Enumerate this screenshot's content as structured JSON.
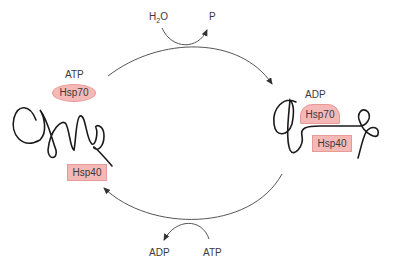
{
  "diagram": {
    "colors": {
      "chaperone_fill": "#f4b9b6",
      "chaperone_border": "#e89a96",
      "line": "#555555",
      "strand": "#1a1a1a"
    },
    "top_reaction": {
      "input": "H2O",
      "input_main": "H",
      "input_sub": "2",
      "input_tail": "O",
      "output": "P"
    },
    "bottom_reaction": {
      "input": "ATP",
      "output": "ADP"
    },
    "left_state": {
      "nucleotide": "ATP",
      "hsp70": "Hsp70",
      "hsp40": "Hsp40",
      "hsp70_shape": "ellipse"
    },
    "right_state": {
      "nucleotide": "ADP",
      "hsp70": "Hsp70",
      "hsp40": "Hsp40",
      "hsp70_shape": "dome"
    }
  }
}
